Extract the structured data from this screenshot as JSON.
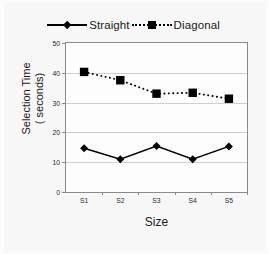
{
  "chart_data": {
    "type": "line",
    "title": "",
    "xlabel": "Size",
    "ylabel": "Selection Time ( seconds)",
    "ylabel_line1": "Selection Time",
    "ylabel_line2": "( seconds)",
    "categories": [
      "S1",
      "S2",
      "S3",
      "S4",
      "S5"
    ],
    "ylim": [
      0,
      50
    ],
    "yticks": [
      0,
      10,
      20,
      30,
      40,
      50
    ],
    "ytick_labels": [
      "0",
      "10",
      "20",
      "30",
      "40",
      "50"
    ],
    "grid": "horizontal",
    "legend_position": "top-center",
    "series": [
      {
        "name": "Straight",
        "values": [
          14.7,
          11.0,
          15.4,
          11.0,
          15.3
        ],
        "line_style": "solid",
        "marker": "diamond",
        "color": "#000000"
      },
      {
        "name": "Diagonal",
        "values": [
          40.3,
          37.5,
          33.0,
          33.3,
          31.3
        ],
        "line_style": "dotted",
        "marker": "square",
        "color": "#000000"
      }
    ]
  },
  "legend": {
    "entries": [
      {
        "label": "Straight"
      },
      {
        "label": "Diagonal"
      }
    ]
  },
  "colors": {
    "ink": "#000000",
    "frame": "#8a8a8a",
    "grid": "#cfcfcf",
    "card_background": "#f7f7f7",
    "plot_background": "#fdfdfd"
  }
}
